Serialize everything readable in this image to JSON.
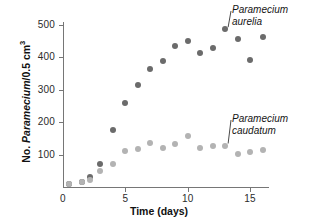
{
  "chart_data": {
    "type": "scatter",
    "title": "",
    "xlabel": "Time (days)",
    "ylabel": "No. Paramecium/0.5 cm3",
    "ylabel_parts": {
      "prefix": "No. ",
      "species": "Paramecium",
      "suffix": "/0.5 cm",
      "superscript": "3"
    },
    "xlim": [
      0,
      16.5
    ],
    "ylim": [
      0,
      520
    ],
    "xticks": [
      0,
      5,
      10,
      15
    ],
    "yticks": [
      100,
      200,
      300,
      400,
      500
    ],
    "grid": false,
    "legend": "annotations on plot",
    "series": [
      {
        "name": "Paramecium aurelia",
        "color": "#6b6b6b",
        "x": [
          0.5,
          1.5,
          2.2,
          3.0,
          4.0,
          5.0,
          6.0,
          7.0,
          8.0,
          9.0,
          10.0,
          11.0,
          12.0,
          13.0,
          14.0,
          15.0,
          16.0
        ],
        "y": [
          10,
          15,
          30,
          72,
          175,
          260,
          315,
          365,
          390,
          435,
          450,
          415,
          430,
          487,
          457,
          393,
          462
        ]
      },
      {
        "name": "Paramecium caudatum",
        "color": "#b3b3b3",
        "x": [
          0.5,
          1.5,
          2.2,
          3.0,
          4.0,
          5.0,
          6.0,
          7.0,
          8.0,
          9.0,
          10.0,
          11.0,
          12.0,
          13.0,
          14.0,
          15.0,
          16.0
        ],
        "y": [
          8,
          14,
          22,
          48,
          72,
          110,
          117,
          135,
          121,
          132,
          157,
          120,
          128,
          128,
          103,
          107,
          115
        ]
      }
    ],
    "annotations": [
      {
        "text_lines": [
          "Paramecium",
          "aurelia"
        ],
        "points_to": {
          "x": 13.0,
          "y": 487
        }
      },
      {
        "text_lines": [
          "Paramecium",
          "caudatum"
        ],
        "points_to": {
          "x": 13.0,
          "y": 128
        }
      }
    ]
  }
}
